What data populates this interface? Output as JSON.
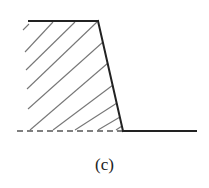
{
  "figure": {
    "caption": "(c)",
    "colors": {
      "outline": "#222222",
      "hatch": "#777777",
      "dashed_base": "#555555",
      "background": "#ffffff"
    },
    "geometry": {
      "top_edge": {
        "x1": 29,
        "y1": 21,
        "x2": 98,
        "y2": 21
      },
      "slope_edge": {
        "x1": 98,
        "y1": 21,
        "x2": 123,
        "y2": 131
      },
      "ground_line": {
        "x1": 123,
        "y1": 131,
        "x2": 196,
        "y2": 131
      },
      "dashed_base": {
        "x1": 17,
        "y1": 131,
        "x2": 123,
        "y2": 131
      },
      "hatch_lines": [
        {
          "x1": 23,
          "y1": 30,
          "x2": 29,
          "y2": 24
        },
        {
          "x1": 25,
          "y1": 52,
          "x2": 53,
          "y2": 22
        },
        {
          "x1": 26,
          "y1": 70,
          "x2": 75,
          "y2": 22
        },
        {
          "x1": 27,
          "y1": 89,
          "x2": 97,
          "y2": 22
        },
        {
          "x1": 28,
          "y1": 109,
          "x2": 103,
          "y2": 42
        },
        {
          "x1": 30,
          "y1": 130,
          "x2": 108,
          "y2": 63
        },
        {
          "x1": 53,
          "y1": 130,
          "x2": 113,
          "y2": 85
        },
        {
          "x1": 75,
          "y1": 130,
          "x2": 117,
          "y2": 103
        },
        {
          "x1": 98,
          "y1": 130,
          "x2": 120,
          "y2": 117
        },
        {
          "x1": 116,
          "y1": 130,
          "x2": 122,
          "y2": 126
        }
      ]
    }
  }
}
